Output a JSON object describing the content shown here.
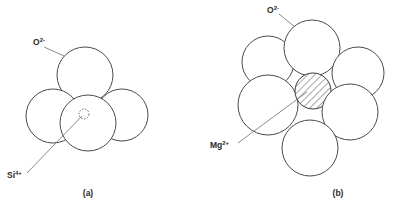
{
  "figure": {
    "background_color": "#ffffff",
    "stroke_color": "#4a4a4a",
    "label_color": "#2b2b2b",
    "panels": [
      {
        "id": "panel-a",
        "caption": "(a)",
        "coordination": "tetrahedral",
        "anion_label_base": "O",
        "anion_label_charge": "2-",
        "cation_label_base": "Si",
        "cation_label_charge": "4+",
        "anion_count": 4,
        "cation_count": 1,
        "cation_fill": "dashed-outline",
        "anions": [
          {
            "name": "oxygen-top",
            "cx": 85,
            "cy": 75,
            "r": 28
          },
          {
            "name": "oxygen-left",
            "cx": 53,
            "cy": 116,
            "r": 27
          },
          {
            "name": "oxygen-right",
            "cx": 122,
            "cy": 115,
            "r": 26
          },
          {
            "name": "oxygen-front",
            "cx": 88,
            "cy": 123,
            "r": 28
          }
        ],
        "cation": {
          "name": "silicon-center",
          "cx": 84,
          "cy": 114,
          "r": 5
        },
        "anion_leader": {
          "x1": 44,
          "y1": 47,
          "x2": 64,
          "y2": 56
        },
        "cation_leader": {
          "x1": 27,
          "y1": 173,
          "x2": 82,
          "y2": 116
        },
        "anion_label_pos": {
          "x": 33,
          "y": 45
        },
        "cation_label_pos": {
          "x": 7,
          "y": 178
        },
        "caption_pos": {
          "x": 88,
          "y": 196
        }
      },
      {
        "id": "panel-b",
        "caption": "(b)",
        "coordination": "octahedral",
        "anion_label_base": "O",
        "anion_label_charge": "2-",
        "cation_label_base": "Mg",
        "cation_label_charge": "2+",
        "anion_count": 6,
        "cation_count": 1,
        "cation_fill": "diagonal-hatch",
        "anions": [
          {
            "name": "oxygen-top",
            "cx": 312,
            "cy": 48,
            "r": 28
          },
          {
            "name": "oxygen-upper-left",
            "cx": 268,
            "cy": 62,
            "r": 26
          },
          {
            "name": "oxygen-left",
            "cx": 268,
            "cy": 105,
            "r": 30
          },
          {
            "name": "oxygen-upper-right",
            "cx": 358,
            "cy": 73,
            "r": 26
          },
          {
            "name": "oxygen-right",
            "cx": 350,
            "cy": 112,
            "r": 28
          },
          {
            "name": "oxygen-bottom",
            "cx": 310,
            "cy": 148,
            "r": 28
          }
        ],
        "cation": {
          "name": "magnesium-center",
          "cx": 313,
          "cy": 91,
          "r": 18
        },
        "anion_leader": {
          "x1": 279,
          "y1": 14,
          "x2": 295,
          "y2": 27
        },
        "cation_leader": {
          "x1": 238,
          "y1": 143,
          "x2": 307,
          "y2": 92
        },
        "anion_label_pos": {
          "x": 267,
          "y": 13
        },
        "cation_label_pos": {
          "x": 210,
          "y": 148
        },
        "caption_pos": {
          "x": 338,
          "y": 196
        }
      }
    ]
  }
}
